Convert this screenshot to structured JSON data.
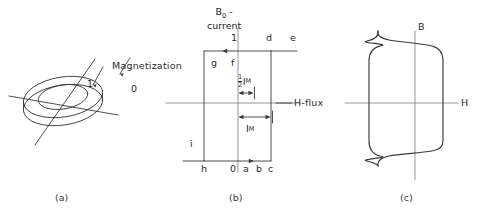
{
  "figure": {
    "background_color": "#ffffff",
    "line_color": "#3a3a3a",
    "text_color": "#2b2b2b"
  },
  "panel_a": {
    "caption": "(a)",
    "magnetization_label": "Magnetization",
    "state_one": "1",
    "state_zero": "0",
    "icon_names": [
      "toroid-core-icon",
      "sense-wire-icon",
      "drive-wire-icon",
      "magnetization-arrow-icon"
    ]
  },
  "panel_b": {
    "caption": "(b)",
    "axis_vertical_label_line1": "B",
    "axis_vertical_label_sub": "0",
    "axis_vertical_label_dash": " -",
    "axis_vertical_label_line2": "current",
    "axis_horizontal_label": "H-flux",
    "corner_labels": {
      "top_one": "1",
      "top_d": "d",
      "top_e": "e",
      "left_g": "g",
      "mid_f": "f",
      "left_i": "i",
      "bottom_h": "h",
      "bottom_origin": "0",
      "bottom_a": "a",
      "bottom_b": "b",
      "bottom_c": "c"
    },
    "dimension_half": {
      "numerator": "1",
      "denominator": "2",
      "symbol": "I",
      "subscript": "M"
    },
    "dimension_full": {
      "symbol": "I",
      "subscript": "M"
    }
  },
  "panel_c": {
    "caption": "(c)",
    "axis_vertical_label": "B",
    "axis_horizontal_label": "H",
    "curve_type": "square-hysteresis-loop"
  }
}
